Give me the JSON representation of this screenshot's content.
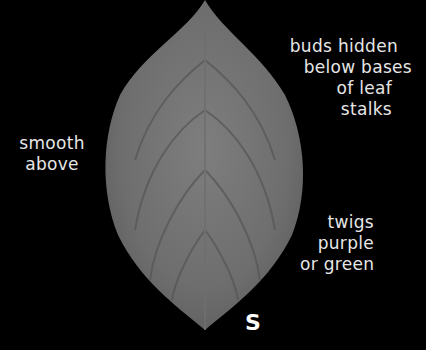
{
  "image": {
    "subject": "leaf",
    "background_color": "#000000",
    "leaf_color": "#7a7a7a"
  },
  "annotations": {
    "buds": [
      "buds hidden",
      "below bases",
      "of leaf",
      "stalks"
    ],
    "surface": [
      "smooth",
      "above"
    ],
    "twigs": [
      "twigs",
      "purple",
      "or green"
    ],
    "marker": "S"
  }
}
